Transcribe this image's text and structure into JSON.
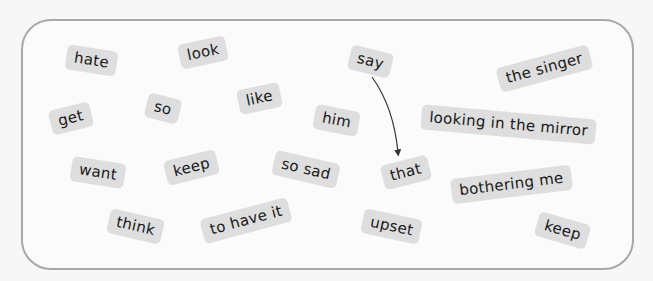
{
  "tiles": [
    {
      "id": "hate",
      "label": "hate"
    },
    {
      "id": "look",
      "label": "look"
    },
    {
      "id": "say",
      "label": "say"
    },
    {
      "id": "the-singer",
      "label": "the singer"
    },
    {
      "id": "get",
      "label": "get"
    },
    {
      "id": "so",
      "label": "so"
    },
    {
      "id": "like",
      "label": "like"
    },
    {
      "id": "him",
      "label": "him"
    },
    {
      "id": "looking-in-the-mirror",
      "label": "looking in the mirror"
    },
    {
      "id": "want",
      "label": "want"
    },
    {
      "id": "keep-1",
      "label": "keep"
    },
    {
      "id": "so-sad",
      "label": "so sad"
    },
    {
      "id": "that",
      "label": "that"
    },
    {
      "id": "bothering-me",
      "label": "bothering me"
    },
    {
      "id": "think",
      "label": "think"
    },
    {
      "id": "to-have-it",
      "label": "to have it"
    },
    {
      "id": "upset",
      "label": "upset"
    },
    {
      "id": "keep-2",
      "label": "keep"
    }
  ],
  "connections": [
    {
      "from": "say",
      "to": "that",
      "style": "curved-arrow"
    }
  ],
  "colors": {
    "tile_bg": "#dedede",
    "tile_text": "#1a1a1a",
    "frame_border": "#a8a8a8",
    "arrow": "#333333"
  }
}
